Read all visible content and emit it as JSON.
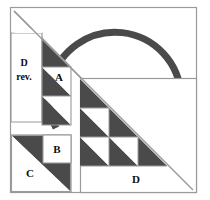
{
  "figure": {
    "canvas": {
      "width": 210,
      "height": 200
    },
    "colors": {
      "dark_fill": "#4a4a4a",
      "light_fill": "#ffffff",
      "outline": "#8a8a8a",
      "box_outline": "#9a9a9a",
      "text": "#0d0d0d",
      "arc_stroke": "#4a4a4a",
      "background": "#ffffff"
    },
    "labels": {
      "a": "A",
      "b": "B",
      "c": "C",
      "d": "D",
      "e": "E",
      "d_rev_line1": "D",
      "d_rev_line2": "rev."
    },
    "label_font_size": 11,
    "d_rev_font_size": 10,
    "regions": [
      {
        "id": "d-rev",
        "label": "D rev.",
        "shape": "right-trapezoid",
        "fill": "light"
      },
      {
        "id": "a",
        "label": "A",
        "shape": "stacked-triangles-column",
        "cells": 3,
        "fill": "mixed"
      },
      {
        "id": "b",
        "label": "B",
        "shape": "square",
        "fill": "light"
      },
      {
        "id": "c",
        "label": "C",
        "shape": "square-with-diagonal",
        "fill": "mixed"
      },
      {
        "id": "d",
        "label": "D",
        "shape": "staircase-triangle",
        "cells": 6,
        "fill": "mixed"
      },
      {
        "id": "e",
        "label": "E",
        "shape": "semicircular-segment",
        "fill": "light"
      }
    ],
    "arc": {
      "name": "thick-semicircle-arc",
      "center_x": 118,
      "center_y": 102,
      "radius": 66,
      "stroke_width": 7
    },
    "outer_square": {
      "left": 10,
      "top": 7,
      "right": 197,
      "bottom": 193
    },
    "main_diagonal": {
      "x1": 14,
      "y1": 11,
      "x2": 193,
      "y2": 190
    }
  }
}
